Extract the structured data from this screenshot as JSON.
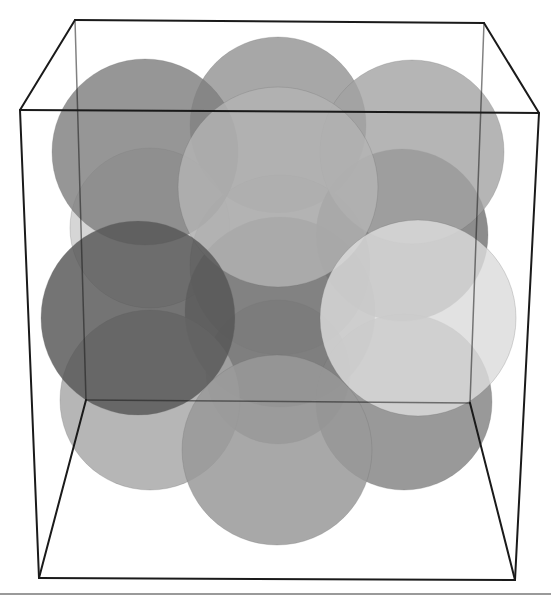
{
  "scene": {
    "description": "3D rendering of overlapping translucent spheres inside a cube wireframe (unit cell)",
    "background": "#ffffff",
    "edge_color": "#1a1a1a",
    "rule_color": "#9a9a9a",
    "cube": {
      "vertices": {
        "back_top_left": [
          75,
          20
        ],
        "back_top_right": [
          484,
          23
        ],
        "back_bottom_left": [
          86,
          400
        ],
        "back_bottom_right": [
          470,
          403
        ],
        "front_top_left": [
          20,
          110
        ],
        "front_top_right": [
          539,
          113
        ],
        "front_bottom_left": [
          39,
          578
        ],
        "front_bottom_right": [
          515,
          580
        ]
      },
      "edges": [
        [
          "back_top_left",
          "back_top_right"
        ],
        [
          "back_top_left",
          "back_bottom_left"
        ],
        [
          "back_top_right",
          "back_bottom_right"
        ],
        [
          "back_bottom_left",
          "back_bottom_right"
        ],
        [
          "front_top_left",
          "front_top_right"
        ],
        [
          "front_top_left",
          "front_bottom_left"
        ],
        [
          "front_top_right",
          "front_bottom_right"
        ],
        [
          "front_bottom_left",
          "front_bottom_right"
        ],
        [
          "back_top_left",
          "front_top_left"
        ],
        [
          "back_top_right",
          "front_top_right"
        ],
        [
          "back_bottom_left",
          "front_bottom_left"
        ],
        [
          "back_bottom_right",
          "front_bottom_right"
        ]
      ],
      "back_edges": [
        [
          "back_top_left",
          "back_bottom_left"
        ],
        [
          "back_top_right",
          "back_bottom_right"
        ],
        [
          "back_bottom_left",
          "back_bottom_right"
        ]
      ]
    },
    "spheres": [
      {
        "id": "back-top-center",
        "cx": 278,
        "cy": 125,
        "r": 88,
        "fill": "#8e8e8e",
        "opacity": 0.78
      },
      {
        "id": "back-mid-left",
        "cx": 150,
        "cy": 228,
        "r": 80,
        "fill": "#c4c4c4",
        "opacity": 0.7
      },
      {
        "id": "back-center",
        "cx": 280,
        "cy": 265,
        "r": 90,
        "fill": "#9a9a9a",
        "opacity": 0.75
      },
      {
        "id": "back-mid-right",
        "cx": 402,
        "cy": 235,
        "r": 86,
        "fill": "#6f6f6f",
        "opacity": 0.8
      },
      {
        "id": "back-lower-center",
        "cx": 278,
        "cy": 372,
        "r": 72,
        "fill": "#8a8a8a",
        "opacity": 0.75
      },
      {
        "id": "top-left",
        "cx": 145,
        "cy": 152,
        "r": 93,
        "fill": "#7f7f7f",
        "opacity": 0.82
      },
      {
        "id": "top-right",
        "cx": 412,
        "cy": 152,
        "r": 92,
        "fill": "#a3a3a3",
        "opacity": 0.8
      },
      {
        "id": "center",
        "cx": 280,
        "cy": 312,
        "r": 95,
        "fill": "#767676",
        "opacity": 0.8
      },
      {
        "id": "lower-left",
        "cx": 150,
        "cy": 400,
        "r": 90,
        "fill": "#a6a6a6",
        "opacity": 0.82
      },
      {
        "id": "lower-right",
        "cx": 404,
        "cy": 402,
        "r": 88,
        "fill": "#838383",
        "opacity": 0.82
      },
      {
        "id": "top-front-center",
        "cx": 278,
        "cy": 187,
        "r": 100,
        "fill": "#b3b3b3",
        "opacity": 0.82
      },
      {
        "id": "mid-left-dark",
        "cx": 138,
        "cy": 318,
        "r": 97,
        "fill": "#555555",
        "opacity": 0.82
      },
      {
        "id": "bottom-front-center",
        "cx": 277,
        "cy": 450,
        "r": 95,
        "fill": "#999999",
        "opacity": 0.85
      },
      {
        "id": "mid-right-light",
        "cx": 418,
        "cy": 318,
        "r": 98,
        "fill": "#dcdcdc",
        "opacity": 0.82
      }
    ]
  }
}
